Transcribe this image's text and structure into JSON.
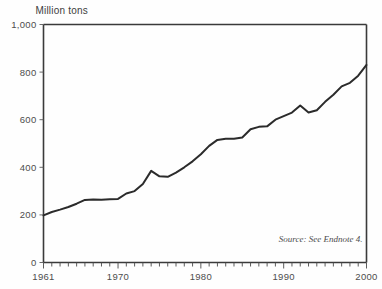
{
  "chart_data": {
    "type": "line",
    "title": "",
    "ylabel": "Million tons",
    "xlabel": "",
    "ylim": [
      0,
      1000
    ],
    "xlim": [
      1961,
      2000
    ],
    "grid": false,
    "legend": null,
    "yticks": [
      0,
      200,
      400,
      600,
      800,
      1000
    ],
    "ytick_labels": [
      "0",
      "200",
      "400",
      "600",
      "800",
      "1,000"
    ],
    "xticks": [
      1961,
      1970,
      1980,
      1990,
      2000
    ],
    "xtick_labels": [
      "1961",
      "1970",
      "1980",
      "1990",
      "2000"
    ],
    "minor_xtick_interval": 1,
    "annotation": "Source: See Endnote 4.",
    "line_color": "#2b2b2b",
    "axis_color": "#3a3a3a",
    "x": [
      1961,
      1962,
      1963,
      1964,
      1965,
      1966,
      1967,
      1968,
      1969,
      1970,
      1971,
      1972,
      1973,
      1974,
      1975,
      1976,
      1977,
      1978,
      1979,
      1980,
      1981,
      1982,
      1983,
      1984,
      1985,
      1986,
      1987,
      1988,
      1989,
      1990,
      1991,
      1992,
      1993,
      1994,
      1995,
      1996,
      1997,
      1998,
      1999,
      2000
    ],
    "values": [
      198,
      212,
      222,
      233,
      247,
      263,
      265,
      264,
      266,
      267,
      290,
      300,
      330,
      385,
      362,
      360,
      378,
      400,
      425,
      455,
      490,
      515,
      520,
      520,
      525,
      560,
      570,
      572,
      600,
      615,
      630,
      660,
      630,
      640,
      675,
      705,
      740,
      755,
      785,
      830
    ]
  }
}
